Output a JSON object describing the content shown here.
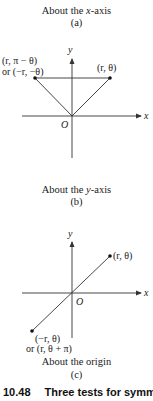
{
  "panel_a": {
    "caption_prefix": "About the ",
    "caption_var": "x",
    "caption_suffix": "-axis",
    "sublabel": "(a)"
  },
  "panel_b": {
    "axis_y_label": "y",
    "axis_x_label": "x",
    "origin_label": "O",
    "point_left_line1": "(r,  π − θ)",
    "point_left_line2": "or (−r, −θ)",
    "point_right": "(r,  θ)",
    "caption_prefix": "About the ",
    "caption_var": "y",
    "caption_suffix": "-axis",
    "sublabel": "(b)"
  },
  "panel_c": {
    "axis_y_label": "y",
    "axis_x_label": "x",
    "origin_label": "O",
    "point_upper": "(r,  θ)",
    "point_lower_line1": "(−r,  θ)",
    "point_lower_line2": "or (r,  θ + π)",
    "caption": "About the origin",
    "sublabel": "(c)"
  },
  "figure_caption": {
    "number": "10.48",
    "title": "Three tests for symme"
  },
  "colors": {
    "line": "#333333",
    "text": "#1a1a1a",
    "background": "#ffffff"
  }
}
